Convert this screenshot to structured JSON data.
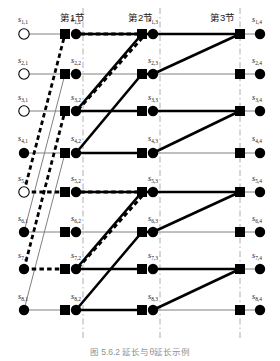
{
  "figure": {
    "caption": "图 5.6.2  延长与θ延长示例",
    "width": 280,
    "height": 361,
    "background": "#ffffff"
  },
  "colors": {
    "ink": "#000000",
    "thin_gray": "#808080",
    "divider": "#9a9a9a",
    "label": "#1a1a1a"
  },
  "sections": [
    {
      "id": "sec-1",
      "label": "第1节",
      "x": 60,
      "y": 10
    },
    {
      "id": "sec-2",
      "label": "第2节",
      "x": 128,
      "y": 10
    },
    {
      "id": "sec-3",
      "label": "第3节",
      "x": 210,
      "y": 10
    }
  ],
  "dividers": [
    {
      "id": "divider-1",
      "x": 83
    },
    {
      "id": "divider-2",
      "x": 160
    },
    {
      "id": "divider-3",
      "x": 240
    }
  ],
  "geometry": {
    "columns_x": [
      24,
      76,
      153,
      234
    ],
    "square_x": [
      0,
      65,
      142,
      223
    ],
    "rows_y": [
      34,
      74,
      111,
      153,
      192,
      232,
      269,
      310
    ],
    "circle_r": 5.2,
    "square_half": 5.0
  },
  "node_labels": [
    {
      "id": "s-1-1",
      "text": "s",
      "sub": "1,1",
      "x": 18,
      "y": 15
    },
    {
      "id": "s-2-1",
      "text": "s",
      "sub": "2,1",
      "x": 18,
      "y": 56
    },
    {
      "id": "s-3-1",
      "text": "s",
      "sub": "3,1",
      "x": 18,
      "y": 93
    },
    {
      "id": "s-4-1",
      "text": "s",
      "sub": "4,1",
      "x": 18,
      "y": 134
    },
    {
      "id": "s-5-1",
      "text": "s",
      "sub": "5,1",
      "x": 18,
      "y": 174
    },
    {
      "id": "s-6-1",
      "text": "s",
      "sub": "6,1",
      "x": 18,
      "y": 214
    },
    {
      "id": "s-7-1",
      "text": "s",
      "sub": "7,1",
      "x": 18,
      "y": 251
    },
    {
      "id": "s-8-1",
      "text": "s",
      "sub": "8,1",
      "x": 18,
      "y": 292
    },
    {
      "id": "s-1-2",
      "text": "s",
      "sub": "1,2",
      "x": 71,
      "y": 15
    },
    {
      "id": "s-2-2",
      "text": "s",
      "sub": "2,2",
      "x": 71,
      "y": 56
    },
    {
      "id": "s-3-2",
      "text": "s",
      "sub": "3,2",
      "x": 71,
      "y": 93
    },
    {
      "id": "s-4-2",
      "text": "s",
      "sub": "4,2",
      "x": 71,
      "y": 134
    },
    {
      "id": "s-5-2",
      "text": "s",
      "sub": "5,2",
      "x": 71,
      "y": 174
    },
    {
      "id": "s-6-2",
      "text": "s",
      "sub": "6,2",
      "x": 71,
      "y": 214
    },
    {
      "id": "s-7-2",
      "text": "s",
      "sub": "7,2",
      "x": 71,
      "y": 251
    },
    {
      "id": "s-8-2",
      "text": "s",
      "sub": "8,2",
      "x": 71,
      "y": 292
    },
    {
      "id": "s-1-3",
      "text": "s",
      "sub": "1,3",
      "x": 148,
      "y": 15
    },
    {
      "id": "s-2-3",
      "text": "s",
      "sub": "2,3",
      "x": 148,
      "y": 56
    },
    {
      "id": "s-3-3",
      "text": "s",
      "sub": "3,3",
      "x": 148,
      "y": 93
    },
    {
      "id": "s-4-3",
      "text": "s",
      "sub": "4,3",
      "x": 148,
      "y": 134
    },
    {
      "id": "s-5-3",
      "text": "s",
      "sub": "5,3",
      "x": 148,
      "y": 174
    },
    {
      "id": "s-6-3",
      "text": "s",
      "sub": "6,3",
      "x": 148,
      "y": 214
    },
    {
      "id": "s-7-3",
      "text": "s",
      "sub": "7,3",
      "x": 148,
      "y": 251
    },
    {
      "id": "s-8-3",
      "text": "s",
      "sub": "8,3",
      "x": 148,
      "y": 292
    },
    {
      "id": "s-1-4",
      "text": "s",
      "sub": "1,4",
      "x": 252,
      "y": 15
    },
    {
      "id": "s-2-4",
      "text": "s",
      "sub": "2,4",
      "x": 252,
      "y": 56
    },
    {
      "id": "s-3-4",
      "text": "s",
      "sub": "3,4",
      "x": 252,
      "y": 93
    },
    {
      "id": "s-4-4",
      "text": "s",
      "sub": "4,4",
      "x": 252,
      "y": 134
    },
    {
      "id": "s-5-4",
      "text": "s",
      "sub": "5,4",
      "x": 252,
      "y": 174
    },
    {
      "id": "s-6-4",
      "text": "s",
      "sub": "6,4",
      "x": 252,
      "y": 214
    },
    {
      "id": "s-7-4",
      "text": "s",
      "sub": "7,4",
      "x": 252,
      "y": 251
    },
    {
      "id": "s-8-4",
      "text": "s",
      "sub": "8,4",
      "x": 252,
      "y": 292
    }
  ],
  "circles": [
    {
      "id": "c-1-1",
      "row": 1,
      "col": 1,
      "x": 24,
      "y": 34,
      "fill": "open"
    },
    {
      "id": "c-2-1",
      "row": 2,
      "col": 1,
      "x": 24,
      "y": 74,
      "fill": "open"
    },
    {
      "id": "c-3-1",
      "row": 3,
      "col": 1,
      "x": 24,
      "y": 111,
      "fill": "open"
    },
    {
      "id": "c-4-1",
      "row": 4,
      "col": 1,
      "x": 24,
      "y": 153,
      "fill": "solid"
    },
    {
      "id": "c-5-1",
      "row": 5,
      "col": 1,
      "x": 24,
      "y": 192,
      "fill": "open"
    },
    {
      "id": "c-6-1",
      "row": 6,
      "col": 1,
      "x": 24,
      "y": 232,
      "fill": "solid"
    },
    {
      "id": "c-7-1",
      "row": 7,
      "col": 1,
      "x": 24,
      "y": 269,
      "fill": "solid"
    },
    {
      "id": "c-8-1",
      "row": 8,
      "col": 1,
      "x": 24,
      "y": 310,
      "fill": "solid"
    },
    {
      "id": "c-1-2",
      "row": 1,
      "col": 2,
      "x": 76,
      "y": 34,
      "fill": "solid"
    },
    {
      "id": "c-2-2",
      "row": 2,
      "col": 2,
      "x": 76,
      "y": 74,
      "fill": "solid"
    },
    {
      "id": "c-3-2",
      "row": 3,
      "col": 2,
      "x": 76,
      "y": 111,
      "fill": "solid"
    },
    {
      "id": "c-4-2",
      "row": 4,
      "col": 2,
      "x": 76,
      "y": 153,
      "fill": "solid"
    },
    {
      "id": "c-5-2",
      "row": 5,
      "col": 2,
      "x": 76,
      "y": 192,
      "fill": "solid"
    },
    {
      "id": "c-6-2",
      "row": 6,
      "col": 2,
      "x": 76,
      "y": 232,
      "fill": "solid"
    },
    {
      "id": "c-7-2",
      "row": 7,
      "col": 2,
      "x": 76,
      "y": 269,
      "fill": "solid"
    },
    {
      "id": "c-8-2",
      "row": 8,
      "col": 2,
      "x": 76,
      "y": 310,
      "fill": "solid"
    },
    {
      "id": "c-1-3",
      "row": 1,
      "col": 3,
      "x": 153,
      "y": 34,
      "fill": "solid"
    },
    {
      "id": "c-2-3",
      "row": 2,
      "col": 3,
      "x": 153,
      "y": 74,
      "fill": "solid"
    },
    {
      "id": "c-3-3",
      "row": 3,
      "col": 3,
      "x": 153,
      "y": 111,
      "fill": "solid"
    },
    {
      "id": "c-4-3",
      "row": 4,
      "col": 3,
      "x": 153,
      "y": 153,
      "fill": "solid"
    },
    {
      "id": "c-5-3",
      "row": 5,
      "col": 3,
      "x": 153,
      "y": 192,
      "fill": "solid"
    },
    {
      "id": "c-6-3",
      "row": 6,
      "col": 3,
      "x": 153,
      "y": 232,
      "fill": "solid"
    },
    {
      "id": "c-7-3",
      "row": 7,
      "col": 3,
      "x": 153,
      "y": 269,
      "fill": "solid"
    },
    {
      "id": "c-8-3",
      "row": 8,
      "col": 3,
      "x": 153,
      "y": 310,
      "fill": "solid"
    },
    {
      "id": "c-1-4",
      "row": 1,
      "col": 4,
      "x": 260,
      "y": 34,
      "fill": "solid"
    },
    {
      "id": "c-2-4",
      "row": 2,
      "col": 4,
      "x": 260,
      "y": 74,
      "fill": "solid"
    },
    {
      "id": "c-3-4",
      "row": 3,
      "col": 4,
      "x": 260,
      "y": 111,
      "fill": "solid"
    },
    {
      "id": "c-4-4",
      "row": 4,
      "col": 4,
      "x": 260,
      "y": 153,
      "fill": "solid"
    },
    {
      "id": "c-5-4",
      "row": 5,
      "col": 4,
      "x": 260,
      "y": 192,
      "fill": "solid"
    },
    {
      "id": "c-6-4",
      "row": 6,
      "col": 4,
      "x": 260,
      "y": 232,
      "fill": "solid"
    },
    {
      "id": "c-7-4",
      "row": 7,
      "col": 4,
      "x": 260,
      "y": 269,
      "fill": "solid"
    },
    {
      "id": "c-8-4",
      "row": 8,
      "col": 4,
      "x": 260,
      "y": 310,
      "fill": "solid"
    }
  ],
  "squares": [
    {
      "id": "q-1-1",
      "row": 1,
      "x": 65,
      "y": 34
    },
    {
      "id": "q-2-1",
      "row": 2,
      "x": 65,
      "y": 74
    },
    {
      "id": "q-3-1",
      "row": 3,
      "x": 65,
      "y": 111
    },
    {
      "id": "q-4-1",
      "row": 4,
      "x": 65,
      "y": 153
    },
    {
      "id": "q-5-1",
      "row": 5,
      "x": 65,
      "y": 192
    },
    {
      "id": "q-6-1",
      "row": 6,
      "x": 65,
      "y": 232
    },
    {
      "id": "q-7-1",
      "row": 7,
      "x": 65,
      "y": 269
    },
    {
      "id": "q-8-1",
      "row": 8,
      "x": 65,
      "y": 310
    },
    {
      "id": "q-1-2",
      "row": 1,
      "x": 142,
      "y": 34
    },
    {
      "id": "q-2-2",
      "row": 2,
      "x": 142,
      "y": 74
    },
    {
      "id": "q-3-2",
      "row": 3,
      "x": 142,
      "y": 111
    },
    {
      "id": "q-4-2",
      "row": 4,
      "x": 142,
      "y": 153
    },
    {
      "id": "q-5-2",
      "row": 5,
      "x": 142,
      "y": 192
    },
    {
      "id": "q-6-2",
      "row": 6,
      "x": 142,
      "y": 232
    },
    {
      "id": "q-7-2",
      "row": 7,
      "x": 142,
      "y": 269
    },
    {
      "id": "q-8-2",
      "row": 8,
      "x": 142,
      "y": 310
    },
    {
      "id": "q-1-3",
      "row": 1,
      "x": 240,
      "y": 34
    },
    {
      "id": "q-2-3",
      "row": 2,
      "x": 240,
      "y": 74
    },
    {
      "id": "q-3-3",
      "row": 3,
      "x": 240,
      "y": 111
    },
    {
      "id": "q-4-3",
      "row": 4,
      "x": 240,
      "y": 153
    },
    {
      "id": "q-5-3",
      "row": 5,
      "x": 240,
      "y": 192
    },
    {
      "id": "q-6-3",
      "row": 6,
      "x": 240,
      "y": 232
    },
    {
      "id": "q-7-3",
      "row": 7,
      "x": 240,
      "y": 269
    },
    {
      "id": "q-8-3",
      "row": 8,
      "x": 240,
      "y": 310
    }
  ],
  "edges": {
    "thin_horizontal": [
      {
        "id": "h-1a",
        "x1": 24,
        "y1": 34,
        "x2": 65,
        "y2": 34
      },
      {
        "id": "h-2a",
        "x1": 24,
        "y1": 74,
        "x2": 65,
        "y2": 74
      },
      {
        "id": "h-3a",
        "x1": 24,
        "y1": 111,
        "x2": 65,
        "y2": 111
      },
      {
        "id": "h-4a",
        "x1": 24,
        "y1": 153,
        "x2": 65,
        "y2": 153
      },
      {
        "id": "h-6a",
        "x1": 24,
        "y1": 232,
        "x2": 65,
        "y2": 232
      },
      {
        "id": "h-8a",
        "x1": 24,
        "y1": 310,
        "x2": 65,
        "y2": 310
      },
      {
        "id": "h-2b",
        "x1": 65,
        "y1": 74,
        "x2": 142,
        "y2": 74
      },
      {
        "id": "h-6b",
        "x1": 65,
        "y1": 232,
        "x2": 142,
        "y2": 232
      },
      {
        "id": "h-1c",
        "x1": 153,
        "y1": 34,
        "x2": 240,
        "y2": 34
      },
      {
        "id": "h-2c",
        "x1": 153,
        "y1": 74,
        "x2": 240,
        "y2": 74
      },
      {
        "id": "h-4c",
        "x1": 153,
        "y1": 153,
        "x2": 240,
        "y2": 153
      },
      {
        "id": "h-6c",
        "x1": 153,
        "y1": 232,
        "x2": 240,
        "y2": 232
      },
      {
        "id": "h-8c",
        "x1": 153,
        "y1": 310,
        "x2": 240,
        "y2": 310
      },
      {
        "id": "h-1d",
        "x1": 240,
        "y1": 34,
        "x2": 260,
        "y2": 34
      },
      {
        "id": "h-2d",
        "x1": 240,
        "y1": 74,
        "x2": 260,
        "y2": 74
      },
      {
        "id": "h-3d",
        "x1": 240,
        "y1": 111,
        "x2": 260,
        "y2": 111
      },
      {
        "id": "h-4d",
        "x1": 240,
        "y1": 153,
        "x2": 260,
        "y2": 153
      },
      {
        "id": "h-5d",
        "x1": 240,
        "y1": 192,
        "x2": 260,
        "y2": 192
      },
      {
        "id": "h-6d",
        "x1": 240,
        "y1": 232,
        "x2": 260,
        "y2": 232
      },
      {
        "id": "h-7d",
        "x1": 240,
        "y1": 269,
        "x2": 260,
        "y2": 269
      },
      {
        "id": "h-8d",
        "x1": 240,
        "y1": 310,
        "x2": 260,
        "y2": 310
      }
    ],
    "thin_diagonal": [
      {
        "id": "td-1",
        "x1": 24,
        "y1": 232,
        "x2": 65,
        "y2": 74
      },
      {
        "id": "td-2",
        "x1": 24,
        "y1": 310,
        "x2": 65,
        "y2": 153
      }
    ],
    "thick_solid": [
      {
        "id": "ts-1",
        "x1": 76,
        "y1": 111,
        "x2": 142,
        "y2": 111
      },
      {
        "id": "ts-2",
        "x1": 76,
        "y1": 153,
        "x2": 142,
        "y2": 153
      },
      {
        "id": "ts-3",
        "x1": 76,
        "y1": 269,
        "x2": 142,
        "y2": 269
      },
      {
        "id": "ts-4",
        "x1": 76,
        "y1": 310,
        "x2": 142,
        "y2": 310
      },
      {
        "id": "ts-5",
        "x1": 76,
        "y1": 111,
        "x2": 142,
        "y2": 34
      },
      {
        "id": "ts-6",
        "x1": 76,
        "y1": 153,
        "x2": 142,
        "y2": 74
      },
      {
        "id": "ts-7",
        "x1": 76,
        "y1": 269,
        "x2": 142,
        "y2": 192
      },
      {
        "id": "ts-8",
        "x1": 76,
        "y1": 310,
        "x2": 142,
        "y2": 232
      },
      {
        "id": "ts-9",
        "x1": 142,
        "y1": 34,
        "x2": 153,
        "y2": 34
      },
      {
        "id": "ts-10",
        "x1": 142,
        "y1": 74,
        "x2": 153,
        "y2": 74
      },
      {
        "id": "ts-11",
        "x1": 142,
        "y1": 192,
        "x2": 153,
        "y2": 192
      },
      {
        "id": "ts-12",
        "x1": 142,
        "y1": 232,
        "x2": 153,
        "y2": 232
      },
      {
        "id": "ts-13",
        "x1": 153,
        "y1": 34,
        "x2": 240,
        "y2": 34
      },
      {
        "id": "ts-14",
        "x1": 153,
        "y1": 111,
        "x2": 240,
        "y2": 111
      },
      {
        "id": "ts-15",
        "x1": 153,
        "y1": 192,
        "x2": 240,
        "y2": 192
      },
      {
        "id": "ts-16",
        "x1": 153,
        "y1": 269,
        "x2": 240,
        "y2": 269
      },
      {
        "id": "ts-17",
        "x1": 153,
        "y1": 74,
        "x2": 240,
        "y2": 34
      },
      {
        "id": "ts-18",
        "x1": 153,
        "y1": 153,
        "x2": 240,
        "y2": 111
      },
      {
        "id": "ts-19",
        "x1": 153,
        "y1": 232,
        "x2": 240,
        "y2": 192
      },
      {
        "id": "ts-20",
        "x1": 153,
        "y1": 310,
        "x2": 240,
        "y2": 269
      },
      {
        "id": "ts-21",
        "x1": 76,
        "y1": 34,
        "x2": 142,
        "y2": 34
      },
      {
        "id": "ts-22",
        "x1": 76,
        "y1": 192,
        "x2": 142,
        "y2": 192
      }
    ],
    "thick_dashed": [
      {
        "id": "tdsh-1",
        "x1": 24,
        "y1": 192,
        "x2": 65,
        "y2": 34
      },
      {
        "id": "tdsh-2",
        "x1": 24,
        "y1": 269,
        "x2": 65,
        "y2": 111
      },
      {
        "id": "tdsh-3",
        "x1": 24,
        "y1": 192,
        "x2": 65,
        "y2": 192
      },
      {
        "id": "tdsh-4",
        "x1": 24,
        "y1": 269,
        "x2": 65,
        "y2": 269
      },
      {
        "id": "tdsh-5",
        "x1": 65,
        "y1": 34,
        "x2": 142,
        "y2": 34
      },
      {
        "id": "tdsh-6",
        "x1": 65,
        "y1": 192,
        "x2": 142,
        "y2": 192
      },
      {
        "id": "tdsh-7",
        "x1": 78,
        "y1": 110,
        "x2": 144,
        "y2": 36
      },
      {
        "id": "tdsh-8",
        "x1": 78,
        "y1": 268,
        "x2": 144,
        "y2": 194
      }
    ]
  }
}
